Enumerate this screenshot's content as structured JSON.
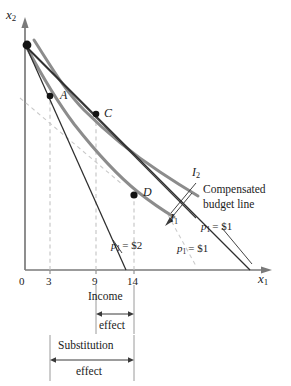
{
  "figure": {
    "type": "economics-indifference-curve-diagram",
    "title_text": "",
    "axes": {
      "y_label": "x",
      "y_label_sub": "2",
      "x_label": "x",
      "x_label_sub": "1",
      "origin_label": "0",
      "x_ticks": [
        {
          "label": "3",
          "value": 3
        },
        {
          "label": "9",
          "value": 9
        },
        {
          "label": "14",
          "value": 14
        }
      ]
    },
    "points": [
      {
        "name": "A",
        "x": 3,
        "note": "original optimum on I1 at p1 = $2"
      },
      {
        "name": "C",
        "x": 9,
        "note": "compensated optimum on I2"
      },
      {
        "name": "D",
        "x": 14,
        "note": "final optimum on I1 at p1 = $1"
      }
    ],
    "curves": [
      {
        "name": "I",
        "sub": "2",
        "label": "I",
        "label_sub": "2"
      },
      {
        "name": "I",
        "sub": "1",
        "label": "I",
        "label_sub": "1"
      }
    ],
    "budget_lines": [
      {
        "id": "original",
        "price_label": "p",
        "price_sub": "1",
        "price_value": "= $2"
      },
      {
        "id": "compensated",
        "price_label": "p",
        "price_sub": "1",
        "price_value": "= $1"
      },
      {
        "id": "final",
        "price_label": "p",
        "price_sub": "1",
        "price_value": "= $1"
      }
    ],
    "annotations": {
      "compensated_line_1": "Compensated",
      "compensated_line_2": "budget line"
    },
    "brackets": [
      {
        "id": "income-effect",
        "line1": "Income",
        "line2": "effect",
        "from": 9,
        "to": 14
      },
      {
        "id": "substitution-effect",
        "line1": "Substitution",
        "line2": "effect",
        "from": 3,
        "to": 14
      }
    ],
    "colors": {
      "indifference_curve": "#8b8b8b",
      "budget_line": "#2b2b2b",
      "axis": "#6e6e6e",
      "dashed_guide": "#c0c0c0",
      "point_marker": "#111111",
      "text": "#1c1c1c"
    }
  }
}
